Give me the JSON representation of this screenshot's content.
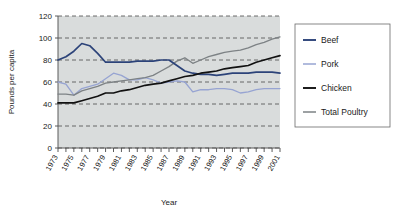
{
  "chart_data": {
    "type": "line",
    "title": "",
    "xlabel": "Year",
    "ylabel": "Pounds per capita",
    "ylim": [
      0,
      120
    ],
    "yticks": [
      0,
      20,
      40,
      60,
      80,
      100,
      120
    ],
    "xlim": [
      1973,
      2001
    ],
    "grid": "horizontal-dashed",
    "legend_position": "right-outside",
    "x": [
      1973,
      1974,
      1975,
      1976,
      1977,
      1978,
      1979,
      1980,
      1981,
      1982,
      1983,
      1984,
      1985,
      1986,
      1987,
      1988,
      1989,
      1990,
      1991,
      1992,
      1993,
      1994,
      1995,
      1996,
      1997,
      1998,
      1999,
      2000,
      2001
    ],
    "xtick_labels": [
      "1973",
      "1975",
      "1977",
      "1979",
      "1981",
      "1983",
      "1985",
      "1987",
      "1989",
      "1991",
      "1993",
      "1995",
      "1997",
      "1999",
      "2001"
    ],
    "series": [
      {
        "name": "Beef",
        "color": "#2c4379",
        "values": [
          80,
          83,
          88,
          95,
          93,
          86,
          78,
          78,
          78,
          78,
          79,
          79,
          79,
          80,
          80,
          75,
          70,
          68,
          67,
          67,
          66,
          67,
          68,
          68,
          68,
          69,
          69,
          69,
          68
        ]
      },
      {
        "name": "Pork",
        "color": "#97a4d2",
        "values": [
          60,
          58,
          48,
          54,
          56,
          58,
          63,
          68,
          66,
          62,
          62,
          64,
          62,
          59,
          60,
          61,
          60,
          51,
          53,
          53,
          54,
          54,
          53,
          50,
          51,
          53,
          54,
          54,
          54
        ]
      },
      {
        "name": "Chicken",
        "color": "#111111",
        "values": [
          41,
          41,
          41,
          43,
          45,
          47,
          50,
          50,
          52,
          53,
          55,
          57,
          58,
          59,
          61,
          63,
          65,
          66,
          68,
          69,
          70,
          72,
          73,
          74,
          75,
          78,
          80,
          82,
          84
        ]
      },
      {
        "name": "Total Poultry",
        "color": "#7d8285",
        "values": [
          49,
          49,
          48,
          52,
          54,
          56,
          59,
          60,
          61,
          62,
          63,
          64,
          66,
          70,
          74,
          79,
          82,
          77,
          80,
          83,
          85,
          87,
          88,
          89,
          91,
          94,
          96,
          99,
          101
        ]
      }
    ]
  },
  "legend": {
    "items": [
      {
        "label": "Beef"
      },
      {
        "label": "Pork"
      },
      {
        "label": "Chicken"
      },
      {
        "label": "Total Poultry"
      }
    ]
  },
  "axes": {
    "y_title": "Pounds per capita",
    "x_title": "Year",
    "y_tick_labels": [
      "0",
      "20",
      "40",
      "60",
      "80",
      "100",
      "120"
    ]
  }
}
